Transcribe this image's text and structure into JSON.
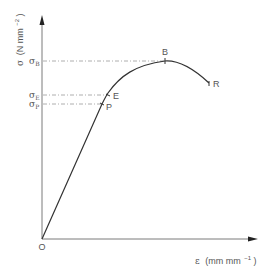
{
  "diagram": {
    "type": "stress-strain curve",
    "y_axis": {
      "label_symbol": "σ",
      "label_units": "(N mm",
      "label_exp": "−2",
      "label_close": ")"
    },
    "x_axis": {
      "label_symbol": "ε",
      "label_units": "(mm mm",
      "label_exp": "−1",
      "label_close": ")"
    },
    "origin_label": "O",
    "points": [
      {
        "id": "P",
        "label": "P",
        "name": "proportional limit"
      },
      {
        "id": "E",
        "label": "E",
        "name": "elastic limit"
      },
      {
        "id": "B",
        "label": "B",
        "name": "ultimate strength"
      },
      {
        "id": "R",
        "label": "R",
        "name": "rupture"
      }
    ],
    "stress_levels": [
      {
        "symbol": "σ",
        "sub": "B"
      },
      {
        "symbol": "σ",
        "sub": "E"
      },
      {
        "symbol": "σ",
        "sub": "P"
      }
    ],
    "colors": {
      "curve": "#333333",
      "axis": "#7a7a7a",
      "guide": "#9a9a9a",
      "text": "#555555"
    }
  }
}
